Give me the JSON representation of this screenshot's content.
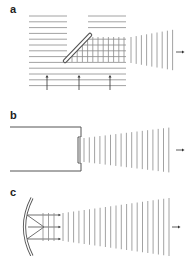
{
  "figure": {
    "width": 187,
    "height": 256,
    "line_color": "#8a8a8a",
    "dark_color": "#555555",
    "panels": [
      {
        "id": "a",
        "label": "a",
        "label_x": 10,
        "label_y": 13
      },
      {
        "id": "b",
        "label": "b",
        "label_x": 10,
        "label_y": 119
      },
      {
        "id": "c",
        "label": "c",
        "label_x": 10,
        "label_y": 196
      }
    ],
    "panel_a": {
      "description": "Plane waves incident from below, reflected by a tilted mirror into a horizontal beam of vertical wavefronts",
      "incident_arrows_x": [
        47,
        79,
        110
      ],
      "output_arrow": "→"
    },
    "panel_b": {
      "description": "Piston in a baffled opening emitting diverging plane wavefronts",
      "output_arrow": "→"
    },
    "panel_c": {
      "description": "Curved reflector focusing rays to produce a diverging wavefront beam",
      "output_arrow": "→"
    }
  }
}
